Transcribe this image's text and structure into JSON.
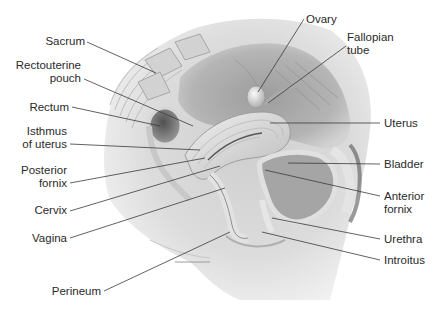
{
  "figure": {
    "colors": {
      "background": "#ffffff",
      "label_text": "#2a2a2a",
      "leader_line": "#3a3a3a",
      "tissue_light": "#e6e6e6",
      "tissue_mid": "#bdbdbd",
      "tissue_dark": "#6e6e6e",
      "skin": "#d9d9d9"
    }
  },
  "labels_left": [
    {
      "id": "sacrum",
      "lines": [
        "Sacrum"
      ]
    },
    {
      "id": "rectouterine-pouch",
      "lines": [
        "Rectouterine",
        "pouch"
      ]
    },
    {
      "id": "rectum",
      "lines": [
        "Rectum"
      ]
    },
    {
      "id": "isthmus-of-uterus",
      "lines": [
        "Isthmus",
        "of uterus"
      ]
    },
    {
      "id": "posterior-fornix",
      "lines": [
        "Posterior",
        "fornix"
      ]
    },
    {
      "id": "cervix",
      "lines": [
        "Cervix"
      ]
    },
    {
      "id": "vagina",
      "lines": [
        "Vagina"
      ]
    },
    {
      "id": "perineum",
      "lines": [
        "Perineum"
      ]
    }
  ],
  "labels_right": [
    {
      "id": "ovary",
      "lines": [
        "Ovary"
      ]
    },
    {
      "id": "fallopian-tube",
      "lines": [
        "Fallopian",
        "tube"
      ]
    },
    {
      "id": "uterus",
      "lines": [
        "Uterus"
      ]
    },
    {
      "id": "bladder",
      "lines": [
        "Bladder"
      ]
    },
    {
      "id": "anterior-fornix",
      "lines": [
        "Anterior",
        "fornix"
      ]
    },
    {
      "id": "urethra",
      "lines": [
        "Urethra"
      ]
    },
    {
      "id": "introitus",
      "lines": [
        "Introitus"
      ]
    }
  ]
}
